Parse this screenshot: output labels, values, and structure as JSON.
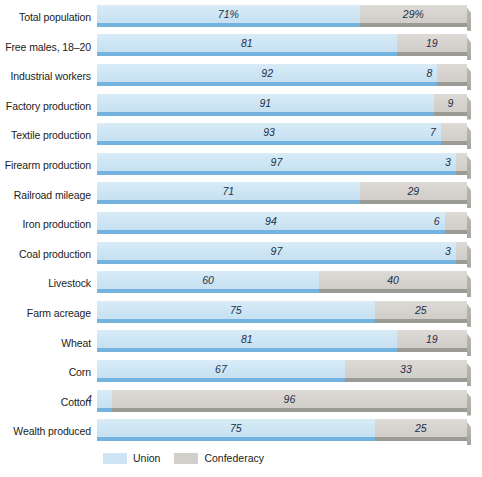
{
  "chart_data": {
    "type": "bar",
    "subtype": "stacked-horizontal-100pct",
    "title": "",
    "xlabel": "",
    "ylabel": "",
    "xlim": [
      0,
      100
    ],
    "grid": false,
    "legend_position": "bottom-left",
    "units": "percent",
    "categories": [
      "Total population",
      "Free males, 18–20",
      "Industrial workers",
      "Factory production",
      "Textile production",
      "Firearm production",
      "Railroad mileage",
      "Iron production",
      "Coal production",
      "Livestock",
      "Farm acreage",
      "Wheat",
      "Corn",
      "Cotton",
      "Wealth produced"
    ],
    "series": [
      {
        "name": "Union",
        "color": "#cde5f4",
        "values": [
          71,
          81,
          92,
          91,
          93,
          97,
          71,
          94,
          97,
          60,
          75,
          81,
          67,
          4,
          75
        ]
      },
      {
        "name": "Confederacy",
        "color": "#d2cfca",
        "values": [
          29,
          19,
          8,
          9,
          7,
          3,
          29,
          6,
          3,
          40,
          25,
          19,
          33,
          96,
          25
        ]
      }
    ],
    "data_labels": {
      "Total population": {
        "union": "71%",
        "confederacy": "29%"
      },
      "Free males, 18–20": {
        "union": "81",
        "confederacy": "19"
      },
      "Industrial workers": {
        "union": "92",
        "confederacy": "8"
      },
      "Factory production": {
        "union": "91",
        "confederacy": "9"
      },
      "Textile production": {
        "union": "93",
        "confederacy": "7"
      },
      "Firearm production": {
        "union": "97",
        "confederacy": "3"
      },
      "Railroad mileage": {
        "union": "71",
        "confederacy": "29"
      },
      "Iron production": {
        "union": "94",
        "confederacy": "6"
      },
      "Coal production": {
        "union": "97",
        "confederacy": "3"
      },
      "Livestock": {
        "union": "60",
        "confederacy": "40"
      },
      "Farm acreage": {
        "union": "75",
        "confederacy": "25"
      },
      "Wheat": {
        "union": "81",
        "confederacy": "19"
      },
      "Corn": {
        "union": "67",
        "confederacy": "33"
      },
      "Cotton": {
        "union": "4",
        "confederacy": "96"
      },
      "Wealth produced": {
        "union": "75",
        "confederacy": "25"
      }
    }
  },
  "rows": [
    {
      "label": "Total population",
      "union": 71,
      "confederacy": 29,
      "union_label": "71%",
      "conf_label": "29%"
    },
    {
      "label": "Free males, 18–20",
      "union": 81,
      "confederacy": 19,
      "union_label": "81",
      "conf_label": "19"
    },
    {
      "label": "Industrial workers",
      "union": 92,
      "confederacy": 8,
      "union_label": "92",
      "conf_label": "8"
    },
    {
      "label": "Factory production",
      "union": 91,
      "confederacy": 9,
      "union_label": "91",
      "conf_label": "9"
    },
    {
      "label": "Textile production",
      "union": 93,
      "confederacy": 7,
      "union_label": "93",
      "conf_label": "7"
    },
    {
      "label": "Firearm production",
      "union": 97,
      "confederacy": 3,
      "union_label": "97",
      "conf_label": "3"
    },
    {
      "label": "Railroad mileage",
      "union": 71,
      "confederacy": 29,
      "union_label": "71",
      "conf_label": "29"
    },
    {
      "label": "Iron production",
      "union": 94,
      "confederacy": 6,
      "union_label": "94",
      "conf_label": "6"
    },
    {
      "label": "Coal production",
      "union": 97,
      "confederacy": 3,
      "union_label": "97",
      "conf_label": "3"
    },
    {
      "label": "Livestock",
      "union": 60,
      "confederacy": 40,
      "union_label": "60",
      "conf_label": "40"
    },
    {
      "label": "Farm acreage",
      "union": 75,
      "confederacy": 25,
      "union_label": "75",
      "conf_label": "25"
    },
    {
      "label": "Wheat",
      "union": 81,
      "confederacy": 19,
      "union_label": "81",
      "conf_label": "19"
    },
    {
      "label": "Corn",
      "union": 67,
      "confederacy": 33,
      "union_label": "67",
      "conf_label": "33"
    },
    {
      "label": "Cotton",
      "union": 4,
      "confederacy": 96,
      "union_label": "4",
      "conf_label": "96"
    },
    {
      "label": "Wealth produced",
      "union": 75,
      "confederacy": 25,
      "union_label": "75",
      "conf_label": "25"
    }
  ],
  "legend": {
    "items": [
      {
        "label": "Union",
        "color": "#cde5f4"
      },
      {
        "label": "Confederacy",
        "color": "#d2cfca"
      }
    ]
  },
  "colors": {
    "union_fill": "#cde5f4",
    "union_edge": "#74b2e0",
    "confederacy_fill": "#d2cfca",
    "confederacy_edge": "#9b9b96",
    "label_text": "#1c1c1c",
    "value_text": "#22304a",
    "background": "#ffffff"
  }
}
